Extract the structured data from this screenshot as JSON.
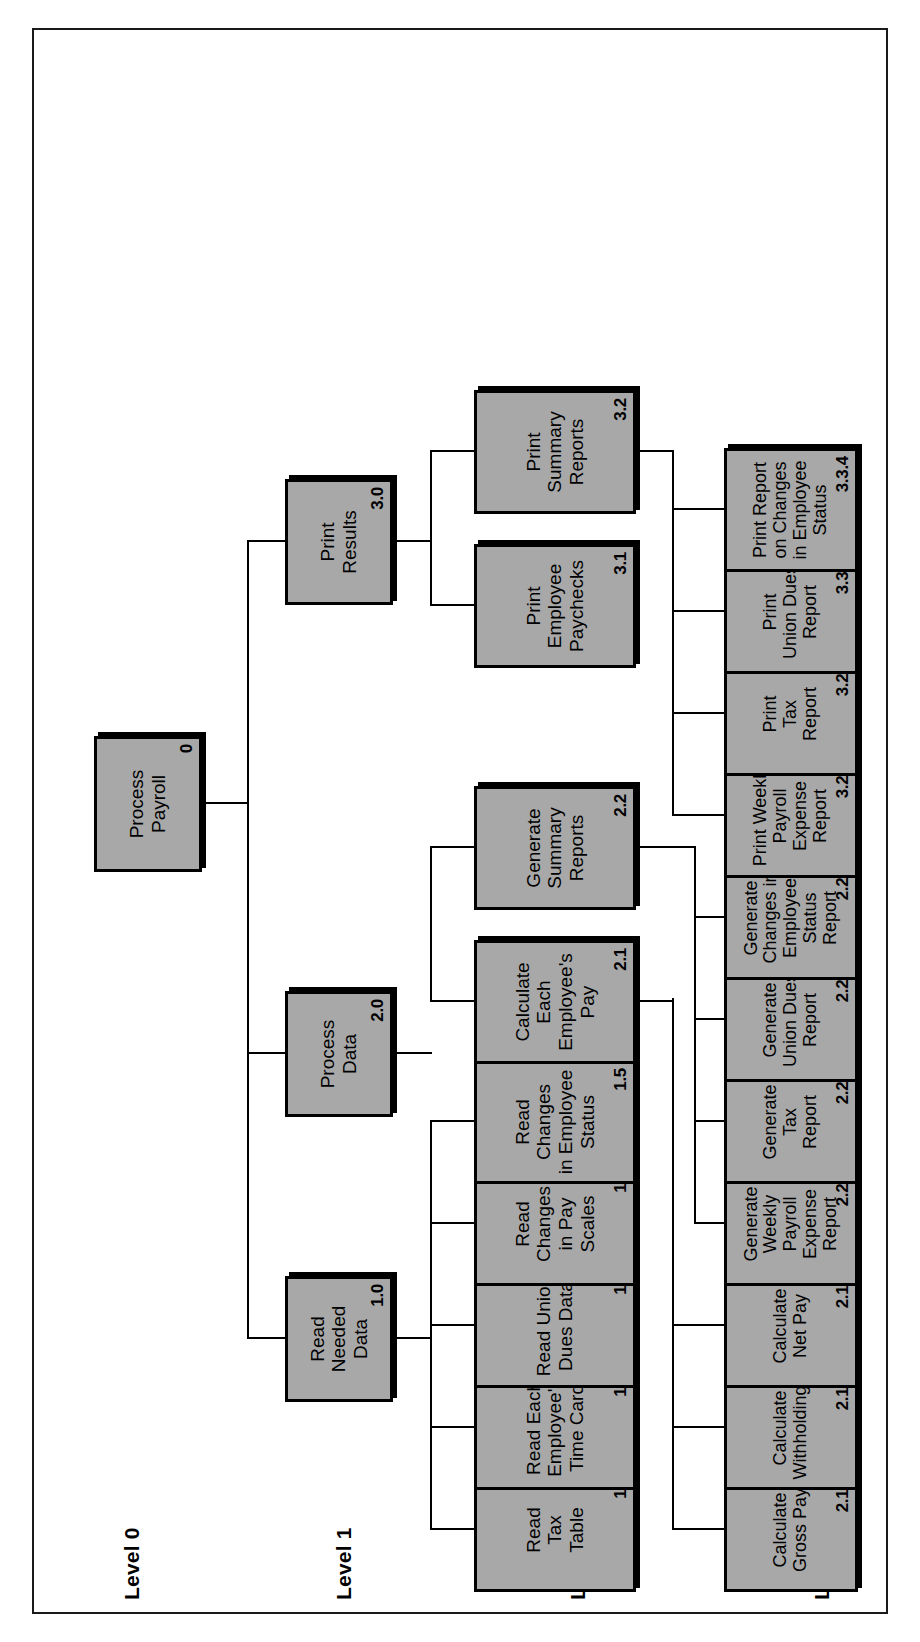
{
  "figure": {
    "kind": "structure-chart",
    "orientation": "rotated-90-ccw",
    "box_fill": "#a8a8a8",
    "box_stroke": "#000000",
    "background": "#ffffff"
  },
  "levels": [
    {
      "id": "level-0",
      "label": "Level 0"
    },
    {
      "id": "level-1",
      "label": "Level 1"
    },
    {
      "id": "level-2",
      "label": "Level 2"
    },
    {
      "id": "level-3",
      "label": "Level 3"
    }
  ],
  "nodes": {
    "root": {
      "title": "Process\nPayroll",
      "num": "0"
    },
    "l1_read": {
      "title": "Read\nNeeded\nData",
      "num": "1.0"
    },
    "l1_process": {
      "title": "Process\nData",
      "num": "2.0"
    },
    "l1_print": {
      "title": "Print\nResults",
      "num": "3.0"
    },
    "n11": {
      "title": "Read\nTax\nTable",
      "num": "1.1"
    },
    "n12": {
      "title": "Read Each\nEmployee's\nTime Card",
      "num": "1.2"
    },
    "n13": {
      "title": "Read Union\nDues Data",
      "num": "1.3"
    },
    "n14": {
      "title": "Read\nChanges\nin Pay\nScales",
      "num": "1.4"
    },
    "n15": {
      "title": "Read\nChanges\nin Employee\nStatus",
      "num": "1.5"
    },
    "n21": {
      "title": "Calculate\nEach\nEmployee's\nPay",
      "num": "2.1"
    },
    "n22": {
      "title": "Generate\nSummary\nReports",
      "num": "2.2"
    },
    "n31": {
      "title": "Print\nEmployee\nPaychecks",
      "num": "3.1"
    },
    "n32": {
      "title": "Print\nSummary\nReports",
      "num": "3.2"
    },
    "n211": {
      "title": "Calculate\nGross Pay",
      "num": "2.1.1"
    },
    "n212": {
      "title": "Calculate\nWithholdings",
      "num": "2.1.2"
    },
    "n213": {
      "title": "Calculate\nNet Pay",
      "num": "2.1.3"
    },
    "n221": {
      "title": "Generate\nWeekly\nPayroll\nExpense\nReport",
      "num": "2.2.1"
    },
    "n222": {
      "title": "Generate\nTax\nReport",
      "num": "2.2.2"
    },
    "n223": {
      "title": "Generate\nUnion Dues\nReport",
      "num": "2.2.3"
    },
    "n224": {
      "title": "Generate\nChanges in\nEmployee\nStatus\nReport",
      "num": "2.2.4"
    },
    "n321": {
      "title": "Print Weekly\nPayroll\nExpense\nReport",
      "num": "3.2.1"
    },
    "n322": {
      "title": "Print\nTax\nReport",
      "num": "3.2.2"
    },
    "n333": {
      "title": "Print\nUnion Dues\nReport",
      "num": "3.3.3"
    },
    "n334": {
      "title": "Print Report\non Changes\nin Employee\nStatus",
      "num": "3.3.4"
    }
  }
}
